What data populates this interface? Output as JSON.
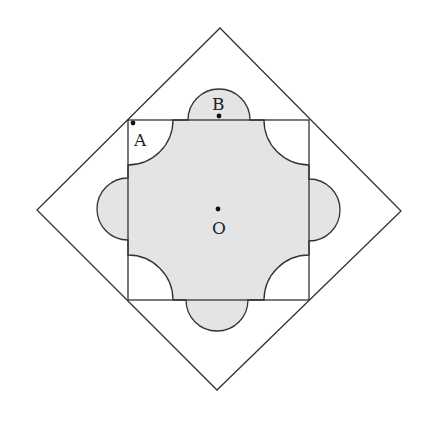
{
  "diagram": {
    "type": "geometry",
    "colors": {
      "stroke": "#333333",
      "fill": "#e4e4e4",
      "background": "#ffffff"
    },
    "outer_diamond": {
      "top": [
        220,
        28
      ],
      "right": [
        401,
        211
      ],
      "bottom": [
        217,
        390
      ],
      "left": [
        37,
        210
      ]
    },
    "inner_square": {
      "x1": 128,
      "y1": 120,
      "x2": 309,
      "y2": 300
    },
    "corner_arc_radius": 45,
    "edge_semicircle_radius": 31,
    "points": [
      {
        "name": "A",
        "label": "A",
        "dot": [
          133,
          123
        ],
        "label_pos": [
          134,
          146
        ]
      },
      {
        "name": "B",
        "label": "B",
        "dot": [
          219,
          116
        ],
        "label_pos": [
          212,
          110
        ]
      },
      {
        "name": "O",
        "label": "O",
        "dot": [
          218,
          209
        ],
        "label_pos": [
          212,
          234
        ]
      }
    ]
  }
}
